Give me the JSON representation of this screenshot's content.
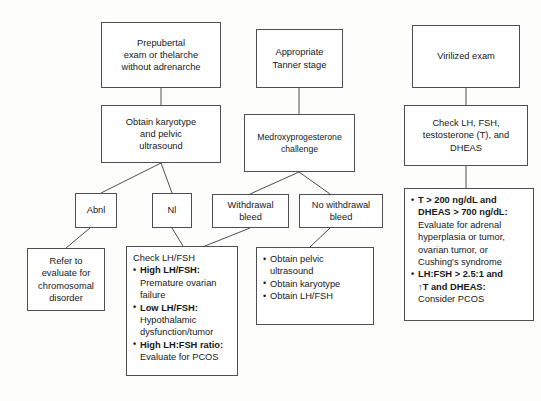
{
  "diagram": {
    "stroke_color": "#4d4f52",
    "background_color": "#fdfdfc",
    "nodes": {
      "prepubertal_exam": {
        "lines": [
          "Prepubertal",
          "exam or thelarche",
          "without adrenarche"
        ]
      },
      "appropriate_tanner": {
        "lines": [
          "Appropriate",
          "Tanner stage"
        ]
      },
      "virilized_exam": {
        "lines": [
          "Virilized exam"
        ]
      },
      "obtain_karyotype": {
        "lines": [
          "Obtain karyotype",
          "and pelvic",
          "ultrasound"
        ]
      },
      "medroxyprogesterone": {
        "lines": [
          "Medroxyprogesterone",
          "challenge"
        ]
      },
      "check_lh_fsh_t": {
        "lines": [
          "Check LH, FSH,",
          "testosterone (T), and",
          "DHEAS"
        ]
      },
      "abnl": {
        "lines": [
          "Abnl"
        ]
      },
      "nl": {
        "lines": [
          "Nl"
        ]
      },
      "withdrawal_bleed": {
        "lines": [
          "Withdrawal",
          "bleed"
        ]
      },
      "no_withdrawal_bleed": {
        "lines": [
          "No withdrawal",
          "bleed"
        ]
      },
      "refer_chromosomal": {
        "lines": [
          "Refer to",
          "evaluate for",
          "chromosomal",
          "disorder"
        ]
      },
      "check_lh_fsh": {
        "heading": "Check LH/FSH",
        "items": [
          {
            "bold": "High LH/FSH:",
            "detail": [
              "Premature ovarian",
              "failure"
            ]
          },
          {
            "bold": "Low LH/FSH:",
            "detail": [
              "Hypothalamic",
              "dysfunction/tumor"
            ]
          },
          {
            "bold": "High LH:FSH ratio:",
            "detail": [
              "Evaluate for PCOS"
            ]
          }
        ]
      },
      "obtain_pelvic": {
        "items": [
          {
            "text": [
              "Obtain pelvic",
              "ultrasound"
            ]
          },
          {
            "text": [
              "Obtain karyotype"
            ]
          },
          {
            "text": [
              "Obtain LH/FSH"
            ]
          }
        ]
      },
      "virilized_results": {
        "items": [
          {
            "bold": [
              "T > 200 ng/dL and",
              "DHEAS > 700 ng/dL:"
            ],
            "detail": [
              "Evaluate for adrenal",
              "hyperplasia or tumor,",
              "ovarian tumor, or",
              "Cushing's syndrome"
            ]
          },
          {
            "bold": [
              "LH:FSH > 2.5:1 and",
              "↑T and DHEAS:"
            ],
            "detail": [
              "Consider PCOS"
            ]
          }
        ]
      }
    }
  }
}
